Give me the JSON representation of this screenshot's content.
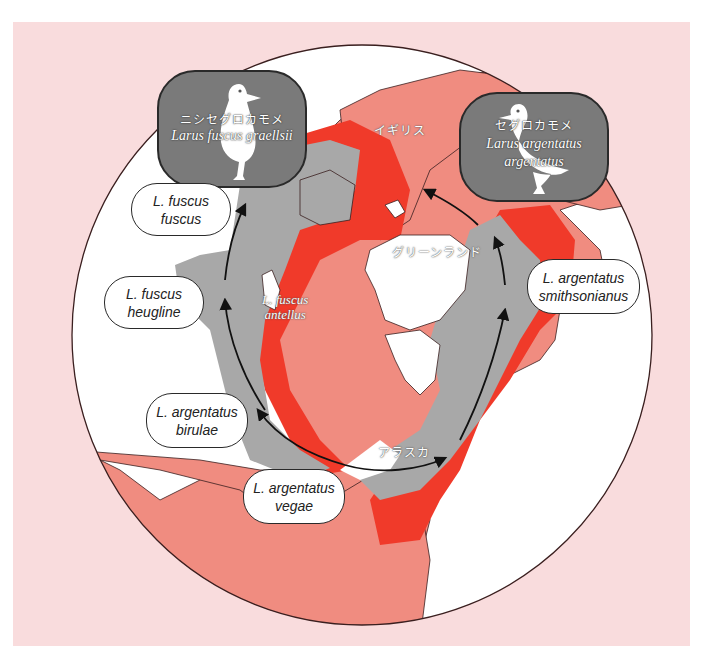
{
  "colors": {
    "page_background": "#f9dcdd",
    "ocean_land_base": "#f08c80",
    "land_outside": "#ffffff",
    "breeding_range_red": "#f03a2a",
    "range_gray": "#a8a8a8",
    "circle_outline": "#3a1f1f"
  },
  "species_badges": {
    "lesser_black_backed": {
      "japanese_name": "ニシセグロカモメ",
      "latin_name": "Larus fuscus graellsii",
      "icon": "gull-silhouette-icon"
    },
    "herring_gull": {
      "japanese_name": "セグロカモメ",
      "latin_name_line1": "Larus argentatus",
      "latin_name_line2": "argentatus",
      "icon": "gull-silhouette-icon"
    }
  },
  "subspecies_labels": {
    "fuscus_fuscus": {
      "line1": "L. fuscus",
      "line2": "fuscus"
    },
    "fuscus_heugline": {
      "line1": "L. fuscus",
      "line2": "heugline"
    },
    "argentatus_birulae": {
      "line1": "L. argentatus",
      "line2": "birulae"
    },
    "argentatus_vegae": {
      "line1": "L. argentatus",
      "line2": "vegae"
    },
    "argentatus_smithsonianus": {
      "line1": "L. argentatus",
      "line2": "smithsonianus"
    }
  },
  "map_labels": {
    "britain": "イギリス",
    "greenland": "グリーンランド",
    "alaska": "アラスカ",
    "fuscus_antellus_line1": "L. fuscus",
    "fuscus_antellus_line2": "antellus"
  }
}
